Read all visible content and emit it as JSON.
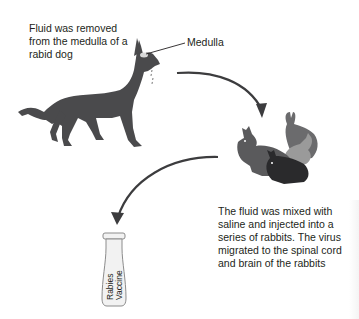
{
  "diagram": {
    "title": "",
    "steps": [
      {
        "id": "dog",
        "caption": "Fluid was removed from the medulla of a rabid dog",
        "callout": "Medulla",
        "icon": "dog-icon"
      },
      {
        "id": "rabbits",
        "caption": "The fluid was mixed with saline and injected into a series of rabbits. The virus migrated to the spinal cord and brain of the rabbits",
        "icon": "rabbits-icon"
      },
      {
        "id": "vaccine",
        "caption": "",
        "vial_label_line1": "Rabies",
        "vial_label_line2": "Vaccine",
        "icon": "vaccine-vial-icon"
      }
    ],
    "arrows": [
      {
        "from": "dog",
        "to": "rabbits"
      },
      {
        "from": "rabbits",
        "to": "vaccine"
      }
    ],
    "colors": {
      "dog": "#4a4a4c",
      "rabbit_mid": "#6b6b6d",
      "rabbit_light": "#9a9a9a",
      "rabbit_dark": "#2a2a2c",
      "arrow": "#3c3c3e",
      "text": "#231f20",
      "vial_fill": "#f2f2f2",
      "vial_stroke": "#8c8c8c"
    }
  }
}
